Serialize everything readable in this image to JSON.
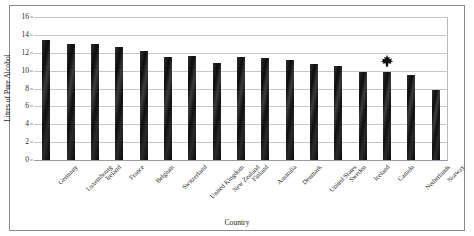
{
  "chart_data": {
    "type": "bar",
    "title": "",
    "xlabel": "Country",
    "ylabel": "Litres of Pure Alcohol",
    "categories": [
      "Germany",
      "Luxembourg",
      "Ireland",
      "France",
      "Belgium",
      "Switzerland",
      "United Kingdom",
      "New Zealand",
      "Finland",
      "Australia",
      "Denmark",
      "United States",
      "Sweden",
      "Iceland",
      "Canada",
      "Netherlands",
      "Norway"
    ],
    "values": [
      13.4,
      13.0,
      13.0,
      12.6,
      12.2,
      11.5,
      11.6,
      10.8,
      11.5,
      11.4,
      11.2,
      10.7,
      10.5,
      9.9,
      9.8,
      9.5,
      7.8
    ],
    "ylim": [
      0,
      16
    ],
    "yticks": [
      0,
      2,
      4,
      6,
      8,
      10,
      12,
      14,
      16
    ],
    "ytick_labels": [
      "0",
      "2",
      "4",
      "6",
      "8",
      "10",
      "12",
      "14",
      "16"
    ],
    "grid": true,
    "legend": null,
    "bar_color": "#141414",
    "gridline_color": "#c6c6c6",
    "annotations": [
      {
        "name": "maple-leaf-marker",
        "icon": "maple-leaf-icon",
        "category": "Canada",
        "value": 9.8,
        "color": "#111111"
      }
    ]
  },
  "figure": {
    "frame_color": "#8a8a8a",
    "background": "#ffffff",
    "clipped_top_text": ""
  }
}
